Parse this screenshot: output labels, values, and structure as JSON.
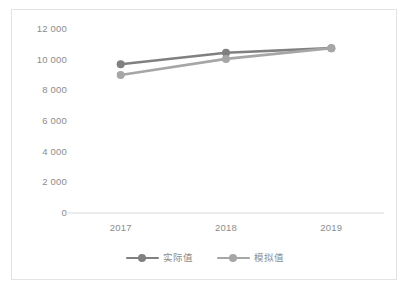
{
  "chart_data": {
    "type": "line",
    "title": "",
    "xlabel": "",
    "ylabel": "",
    "categories": [
      "2017",
      "2018",
      "2019"
    ],
    "ylim": [
      0,
      12000
    ],
    "y_ticks": [
      "0",
      "2 000",
      "4 000",
      "6 000",
      "8 000",
      "10 000",
      "12 000"
    ],
    "y_tick_values": [
      0,
      2000,
      4000,
      6000,
      8000,
      10000,
      12000
    ],
    "grid": false,
    "legend_position": "bottom",
    "series": [
      {
        "name": "实际值",
        "color": "#808080",
        "values": [
          9700,
          10450,
          10750
        ]
      },
      {
        "name": "模拟值",
        "color": "#a6a6a6",
        "values": [
          9000,
          10050,
          10750
        ]
      }
    ]
  },
  "legend": {
    "items": [
      {
        "label": "实际值",
        "swatch_name": "legend-swatch-actual"
      },
      {
        "label": "模拟值",
        "swatch_name": "legend-swatch-simulated"
      }
    ]
  },
  "axis": {
    "baseline_color": "#d9d9d9",
    "tick_label_color": "#8c8c8c"
  },
  "frame": {
    "border_color": "#e3e3e3",
    "background": "#ffffff"
  }
}
